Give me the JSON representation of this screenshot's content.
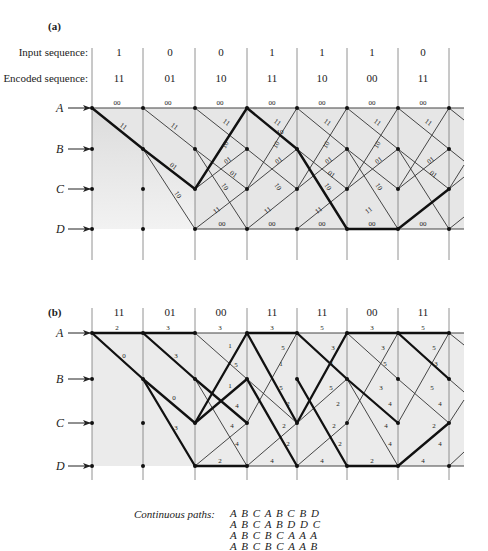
{
  "panel_a": {
    "label": "(a)",
    "input_label": "Input sequence:",
    "encoded_label": "Encoded sequence:",
    "input_sequence": [
      "1",
      "0",
      "0",
      "1",
      "1",
      "1",
      "0"
    ],
    "encoded_sequence": [
      "11",
      "01",
      "10",
      "11",
      "10",
      "00",
      "11"
    ],
    "states": [
      "A",
      "B",
      "C",
      "D"
    ],
    "branch_labels": {
      "A_to_A": "00",
      "A_to_B": "11",
      "B_to_C": "01",
      "B_to_D": "10",
      "C_to_A": "10",
      "C_to_B": "01",
      "D_to_C": "11",
      "D_to_D": "00"
    },
    "extra_label": "10"
  },
  "panel_b": {
    "label": "(b)",
    "encoded_sequence": [
      "11",
      "01",
      "00",
      "11",
      "11",
      "00",
      "11"
    ],
    "states": [
      "A",
      "B",
      "C",
      "D"
    ],
    "path_metrics_A": [
      "2",
      "3",
      "3",
      "3",
      "5",
      "3",
      "5"
    ],
    "path_metrics_D": [
      "",
      "",
      "2",
      "4",
      "4",
      "2",
      "4"
    ]
  },
  "continuous_paths": {
    "caption": "Continuous paths:",
    "rows": [
      "A B C A B C B D",
      "A B C A B D D C",
      "A B C B C A A A",
      "A B C B C A A B"
    ]
  },
  "colors": {
    "line": "#333333",
    "bold_path": "#1a1a1a",
    "shade": "#e4e4e4",
    "node": "#111111"
  }
}
